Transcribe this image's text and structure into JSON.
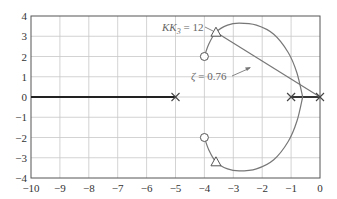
{
  "chart_data": {
    "type": "line",
    "title": "",
    "xlabel": "",
    "ylabel": "",
    "xlim": [
      -10,
      0
    ],
    "ylim": [
      -4,
      4
    ],
    "grid": true,
    "x_ticks": [
      "-10",
      "-9",
      "-8",
      "-7",
      "-6",
      "-5",
      "-4",
      "-3",
      "-2",
      "-1",
      "0"
    ],
    "y_ticks": [
      "4",
      "3",
      "2",
      "1",
      "0",
      "-1",
      "-2",
      "-3",
      "-4"
    ],
    "poles": [
      {
        "x": -5,
        "y": 0
      },
      {
        "x": -1,
        "y": 0
      },
      {
        "x": 0,
        "y": 0
      }
    ],
    "zeros": [
      {
        "x": -4,
        "y": 2
      },
      {
        "x": -4,
        "y": -2
      }
    ],
    "operating_points": [
      {
        "x": -3.6,
        "y": 3.2,
        "label": "KK3 = 12"
      },
      {
        "x": -3.6,
        "y": -3.2
      }
    ],
    "series": [
      {
        "name": "real-axis locus left",
        "x": [
          -10,
          -5
        ],
        "y": [
          0,
          0
        ]
      },
      {
        "name": "real-axis locus right",
        "x": [
          -1,
          0
        ],
        "y": [
          0,
          0
        ]
      },
      {
        "name": "upper branch",
        "x": [
          -4,
          -3.85,
          -3.6,
          -3.2,
          -2.8,
          -2.2,
          -1.6,
          -1.1,
          -0.8,
          -0.6
        ],
        "y": [
          2,
          2.6,
          3.2,
          3.55,
          3.65,
          3.55,
          3.1,
          2.2,
          1.2,
          0
        ]
      },
      {
        "name": "lower branch",
        "x": [
          -4,
          -3.85,
          -3.6,
          -3.2,
          -2.8,
          -2.2,
          -1.6,
          -1.1,
          -0.8,
          -0.6
        ],
        "y": [
          -2,
          -2.6,
          -3.2,
          -3.55,
          -3.65,
          -3.55,
          -3.1,
          -2.2,
          -1.2,
          0
        ]
      },
      {
        "name": "damping ratio line",
        "x": [
          0,
          -3.6
        ],
        "y": [
          0,
          3.2
        ]
      }
    ],
    "annotations": [
      {
        "text_main": "KK",
        "text_sub": "3",
        "text_rest": " = 12",
        "x": -3.6,
        "y": 3.2
      },
      {
        "text_main": "ζ",
        "text_rest": " = 0.76",
        "x": -4.0,
        "y": 1.3
      }
    ]
  }
}
